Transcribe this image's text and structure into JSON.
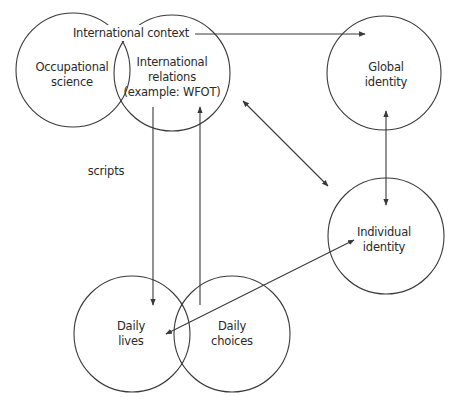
{
  "diagram": {
    "nodes": [
      {
        "id": "occupational-science",
        "lines": [
          "Occupational",
          "science"
        ]
      },
      {
        "id": "international-relations",
        "lines": [
          "International",
          "relations",
          "(example: WFOT)"
        ]
      },
      {
        "id": "global-identity",
        "lines": [
          "Global",
          "identity"
        ]
      },
      {
        "id": "individual-identity",
        "lines": [
          "Individual",
          "identity"
        ]
      },
      {
        "id": "daily-lives",
        "lines": [
          "Daily",
          "lives"
        ]
      },
      {
        "id": "daily-choices",
        "lines": [
          "Daily",
          "choices"
        ]
      }
    ],
    "labels": {
      "international_context": "International context",
      "scripts": "scripts"
    },
    "edges": [
      {
        "from": "international-context",
        "to": "global-identity",
        "direction": "forward"
      },
      {
        "from": "international-relations",
        "to": "daily-lives",
        "direction": "forward"
      },
      {
        "from": "daily-choices",
        "to": "international-relations",
        "direction": "forward"
      },
      {
        "from": "international-relations",
        "to": "individual-identity",
        "direction": "both"
      },
      {
        "from": "global-identity",
        "to": "individual-identity",
        "direction": "both"
      },
      {
        "from": "individual-identity",
        "to": "daily-lives",
        "direction": "both"
      }
    ],
    "colors": {
      "stroke": "#3a3a3a",
      "text": "#2a2a2a",
      "background": "#ffffff"
    }
  }
}
